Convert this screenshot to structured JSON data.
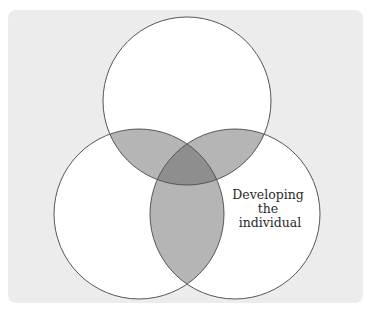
{
  "diagram": {
    "type": "venn",
    "sets": [
      {
        "id": "top",
        "label": ""
      },
      {
        "id": "left",
        "label": ""
      },
      {
        "id": "right",
        "label_lines": [
          "Developing",
          "the",
          "individual"
        ]
      }
    ],
    "colors": {
      "background": "#ececec",
      "circle_fill": "#ffffff",
      "pair_overlap": "#b5b5b5",
      "triple_overlap": "#8e8e8e",
      "stroke": "#555555"
    }
  }
}
